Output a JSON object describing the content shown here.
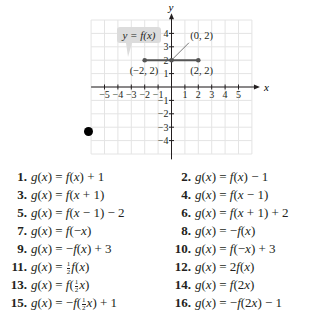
{
  "graph": {
    "label": "y = f(x)",
    "axis_x_label": "x",
    "axis_y_label": "y",
    "x_ticks": [
      "-5",
      "-4",
      "-3",
      "-2",
      "-1",
      "1",
      "2",
      "3",
      "4",
      "5"
    ],
    "y_ticks": [
      "4",
      "3",
      "2",
      "1",
      "-1",
      "-2",
      "-3",
      "-4"
    ],
    "points": [
      {
        "label": "(-2, 2)",
        "x": -2,
        "y": 2
      },
      {
        "label": "(0, 2)",
        "x": 0,
        "y": 2
      },
      {
        "label": "(2, 2)",
        "x": 2,
        "y": 2
      }
    ],
    "segment": {
      "from": [
        -2,
        2
      ],
      "to": [
        2,
        2
      ]
    },
    "grid_range": {
      "x": [
        -6,
        6
      ],
      "y": [
        -5,
        5
      ]
    }
  },
  "chart_data": {
    "type": "line",
    "title": "y = f(x)",
    "xlabel": "x",
    "ylabel": "y",
    "x": [
      -2,
      0,
      2
    ],
    "series": [
      {
        "name": "f(x)",
        "values": [
          2,
          2,
          2
        ]
      }
    ],
    "annotations": [
      "(-2, 2)",
      "(0, 2)",
      "(2, 2)"
    ],
    "xlim": [
      -6,
      6
    ],
    "ylim": [
      -5,
      5
    ],
    "grid": true
  },
  "exercises": [
    {
      "num": "1.",
      "lhs": "g(x) = ",
      "rhs": "f(x) + 1"
    },
    {
      "num": "2.",
      "lhs": "g(x) = ",
      "rhs": "f(x) − 1"
    },
    {
      "num": "3.",
      "lhs": "g(x) = ",
      "rhs": "f(x + 1)"
    },
    {
      "num": "4.",
      "lhs": "g(x) = ",
      "rhs": "f(x − 1)"
    },
    {
      "num": "5.",
      "lhs": "g(x) = ",
      "rhs": "f(x − 1) − 2"
    },
    {
      "num": "6.",
      "lhs": "g(x) = ",
      "rhs": "f(x + 1) + 2"
    },
    {
      "num": "7.",
      "lhs": "g(x) = ",
      "rhs": "f(−x)"
    },
    {
      "num": "8.",
      "lhs": "g(x) = ",
      "rhs": "−f(x)"
    },
    {
      "num": "9.",
      "lhs": "g(x) = ",
      "rhs": "−f(x) + 3"
    },
    {
      "num": "10.",
      "lhs": "g(x) = ",
      "rhs": "f(−x) + 3"
    },
    {
      "num": "11.",
      "lhs": "g(x) = ",
      "pre": "",
      "frac": true,
      "post": "f(x)"
    },
    {
      "num": "12.",
      "lhs": "g(x) = ",
      "rhs": "2f(x)"
    },
    {
      "num": "13.",
      "lhs": "g(x) = ",
      "pre": "f(",
      "frac": true,
      "post": "x)"
    },
    {
      "num": "14.",
      "lhs": "g(x) = ",
      "rhs": "f(2x)"
    },
    {
      "num": "15.",
      "lhs": "g(x) = ",
      "pre": "−f(",
      "frac": true,
      "post": "x) + 1"
    },
    {
      "num": "16.",
      "lhs": "g(x) = ",
      "rhs": "−f(2x) − 1"
    }
  ],
  "fraction": {
    "numerator": "1",
    "denominator": "2"
  }
}
